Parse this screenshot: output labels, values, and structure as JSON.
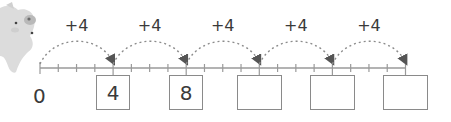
{
  "diagram": {
    "type": "number-line-skip-counting",
    "start_label": "0",
    "step": 4,
    "jump_labels": [
      "+4",
      "+4",
      "+4",
      "+4",
      "+4"
    ],
    "boxes": [
      {
        "value": "4",
        "filled": true
      },
      {
        "value": "8",
        "filled": true
      },
      {
        "value": "",
        "filled": false
      },
      {
        "value": "",
        "filled": false
      },
      {
        "value": "",
        "filled": false
      }
    ],
    "minor_ticks_per_jump": 4,
    "mascot": "pig-icon",
    "colors": {
      "line": "#9a9a9a",
      "arc": "#8c8c8c",
      "text": "#3a3a3a",
      "box_border": "#8a8a8a",
      "mascot": "#d9d9d9"
    }
  }
}
